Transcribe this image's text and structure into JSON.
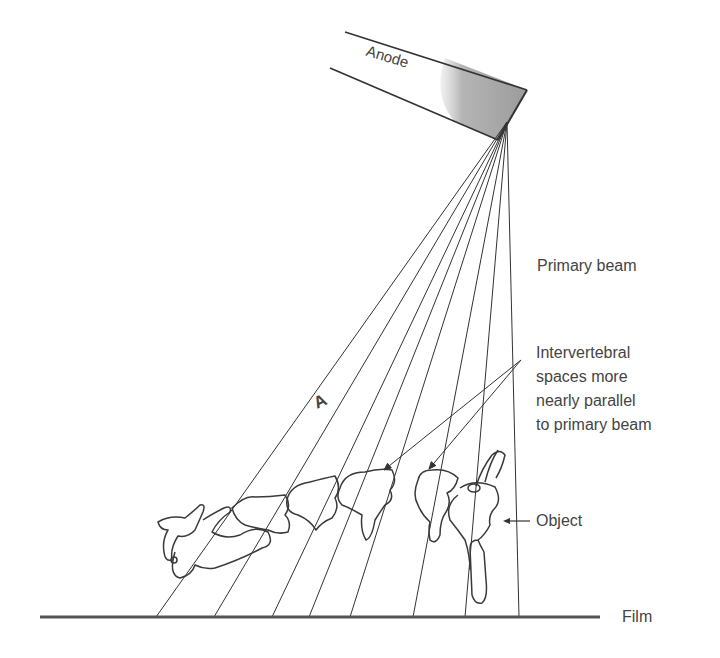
{
  "figure": {
    "labels": {
      "anode": "Anode",
      "primary_beam": "Primary beam",
      "intervertebral": "Intervertebral\nspaces more\nnearly parallel\nto primary beam",
      "object": "Object",
      "film": "Film",
      "panel": "A"
    },
    "colors": {
      "line": "#333333",
      "anode_shading": "#a8a8a8",
      "film": "#555555",
      "text": "#444444"
    },
    "focal_spot": {
      "x": 507,
      "y": 122
    },
    "film_line": {
      "x1": 40,
      "x2": 600,
      "y": 617
    },
    "beam_endpoints_x": [
      156,
      214,
      272,
      309,
      350,
      413,
      465,
      519
    ],
    "leader_origin": {
      "x": 521,
      "y": 360
    },
    "leader_targets": [
      {
        "x": 384,
        "y": 470
      },
      {
        "x": 429,
        "y": 469
      }
    ]
  }
}
